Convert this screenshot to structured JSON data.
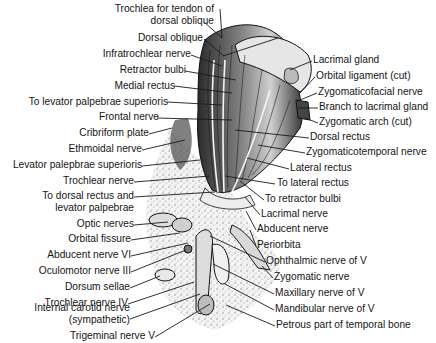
{
  "figure": {
    "labels_left": [
      {
        "text": "Trochlea for tendon of",
        "x": 219,
        "y": 3,
        "ax": 222,
        "ay": 38
      },
      {
        "text": "dorsal oblique",
        "x": 211,
        "y": 16
      },
      {
        "text": "Dorsal oblique",
        "x": 203,
        "y": 33,
        "ax": 224,
        "ay": 56
      },
      {
        "text": "Infratrochlear nerve",
        "x": 190,
        "y": 49,
        "ax": 222,
        "ay": 66
      },
      {
        "text": "Retractor bulbi",
        "x": 184,
        "y": 65,
        "ax": 236,
        "ay": 80
      },
      {
        "text": "Medial rectus",
        "x": 173,
        "y": 80,
        "ax": 232,
        "ay": 93
      },
      {
        "text": "To levator palpebrae superioris",
        "x": 166,
        "y": 96,
        "ax": 222,
        "ay": 105
      },
      {
        "text": "Frontal nerve",
        "x": 156,
        "y": 112,
        "ax": 232,
        "ay": 120
      },
      {
        "text": "Cribriform plate",
        "x": 148,
        "y": 128,
        "ax": 172,
        "ay": 128
      },
      {
        "text": "Ethmoidal nerve",
        "x": 141,
        "y": 144,
        "ax": 185,
        "ay": 140
      },
      {
        "text": "Levator palepbrae superioris",
        "x": 141,
        "y": 160,
        "ax": 200,
        "ay": 160
      },
      {
        "text": "Trochlear nerve",
        "x": 133,
        "y": 176,
        "ax": 210,
        "ay": 176
      },
      {
        "text": "To dorsal rectus and",
        "x": 133,
        "y": 191,
        "ax": 215,
        "ay": 192
      },
      {
        "text": "levator palpebrae",
        "x": 133,
        "y": 203
      },
      {
        "text": "Optic nerves",
        "x": 133,
        "y": 219,
        "ax": 168,
        "ay": 222
      },
      {
        "text": "Orbital fissure",
        "x": 130,
        "y": 234,
        "ax": 180,
        "ay": 233
      },
      {
        "text": "Abducent nerve VI",
        "x": 130,
        "y": 250,
        "ax": 188,
        "ay": 243
      },
      {
        "text": "Oculomotor nerve III",
        "x": 130,
        "y": 266,
        "ax": 186,
        "ay": 250
      },
      {
        "text": "Dorsum sellae",
        "x": 129,
        "y": 282,
        "ax": 160,
        "ay": 276
      },
      {
        "text": "Trochlear nerve IV",
        "x": 127,
        "y": 298,
        "ax": 194,
        "ay": 282
      },
      {
        "text": "Internal carotid nerve",
        "x": 129,
        "y": 313,
        "ax": 200,
        "ay": 294
      },
      {
        "text": "(sympathetic)",
        "x": 129,
        "y": 325
      },
      {
        "text": "Trigeminal nerve V",
        "x": 154,
        "y": 331,
        "ax": 210,
        "ay": 304
      }
    ],
    "labels_right": [
      {
        "text": "Lacrimal gland",
        "x": 313,
        "y": 55,
        "ax": 290,
        "ay": 70
      },
      {
        "text": "Orbital ligament (cut)",
        "x": 316,
        "y": 71,
        "ax": 300,
        "ay": 93
      },
      {
        "text": "Zygomaticofacial nerve",
        "x": 318,
        "y": 87,
        "ax": 300,
        "ay": 100
      },
      {
        "text": "Branch to lacrimal gland",
        "x": 319,
        "y": 102,
        "ax": 298,
        "ay": 108
      },
      {
        "text": "Zygomatic arch (cut)",
        "x": 319,
        "y": 117,
        "ax": 305,
        "ay": 118
      },
      {
        "text": "Dorsal rectus",
        "x": 310,
        "y": 132,
        "ax": 235,
        "ay": 130
      },
      {
        "text": "Zygomaticotemporal nerve",
        "x": 306,
        "y": 147,
        "ax": 258,
        "ay": 145
      },
      {
        "text": "Lateral rectus",
        "x": 290,
        "y": 163,
        "ax": 247,
        "ay": 158
      },
      {
        "text": "To lateral rectus",
        "x": 276,
        "y": 178,
        "ax": 225,
        "ay": 176
      },
      {
        "text": "To retractor bulbi",
        "x": 265,
        "y": 194,
        "ax": 240,
        "ay": 181
      },
      {
        "text": "Lacrimal nerve",
        "x": 261,
        "y": 209,
        "ax": 245,
        "ay": 197
      },
      {
        "text": "Abducent nerve",
        "x": 257,
        "y": 224,
        "ax": 246,
        "ay": 211
      },
      {
        "text": "Periorbita",
        "x": 257,
        "y": 240,
        "ax": 250,
        "ay": 230
      },
      {
        "text": "Ophthalmic nerve of V",
        "x": 266,
        "y": 256,
        "ax": 210,
        "ay": 236
      },
      {
        "text": "Zygomatic nerve",
        "x": 274,
        "y": 272,
        "ax": 262,
        "ay": 266
      },
      {
        "text": "Maxillary nerve of V",
        "x": 275,
        "y": 288,
        "ax": 213,
        "ay": 264
      },
      {
        "text": "Mandibular nerve of V",
        "x": 275,
        "y": 304,
        "ax": 225,
        "ay": 284
      },
      {
        "text": "Petrous part of temporal bone",
        "x": 276,
        "y": 320,
        "ax": 226,
        "ay": 305
      }
    ]
  },
  "colors": {
    "text": "#151515",
    "line": "#1a1a1a",
    "muscle": "#5a5a5a",
    "stipple": "#c8c8c8",
    "background": "#ffffff"
  }
}
